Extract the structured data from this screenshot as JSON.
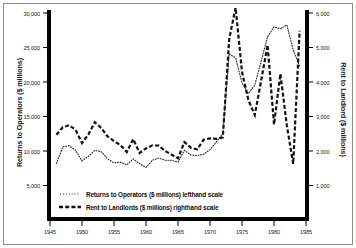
{
  "chart_data": {
    "type": "line",
    "title": "",
    "subtitle": "",
    "xlabel": "",
    "ylabel": "Returns to Operators ($ millions)",
    "ylabel_right": "Rent to Landlord ($ millions)",
    "xlim": [
      1945,
      1985
    ],
    "ylim": [
      0,
      31500
    ],
    "ylim_right": [
      0,
      6300
    ],
    "grid": false,
    "legend_position": "inside-bottom-left",
    "xticks": [
      "1945",
      "1950",
      "1955",
      "1960",
      "1965",
      "1970",
      "1975",
      "1980",
      "1985"
    ],
    "xtick_values": [
      1945,
      1950,
      1955,
      1960,
      1965,
      1970,
      1975,
      1980,
      1985
    ],
    "yticks_left": [
      "5,000",
      "10,000",
      "15,000",
      "20,000",
      "25,000",
      "30,000"
    ],
    "ytick_values_left": [
      5000,
      10000,
      15000,
      20000,
      25000,
      30000
    ],
    "yticks_right": [
      "1,000",
      "2,000",
      "3,000",
      "4,000",
      "5,000",
      "6,000"
    ],
    "ytick_values_right": [
      1000,
      2000,
      3000,
      4000,
      5000,
      6000
    ],
    "x": [
      1946,
      1947,
      1948,
      1949,
      1950,
      1951,
      1952,
      1953,
      1954,
      1955,
      1956,
      1957,
      1958,
      1959,
      1960,
      1961,
      1962,
      1963,
      1964,
      1965,
      1966,
      1967,
      1968,
      1969,
      1970,
      1971,
      1972,
      1973,
      1974,
      1975,
      1976,
      1977,
      1978,
      1979,
      1980,
      1981,
      1982,
      1983,
      1984
    ],
    "series": [
      {
        "name": "Returns to Operators ($ millions) lefthand scale",
        "axis": "left",
        "style": "dotted",
        "color": "#2b2b2b",
        "values": [
          8400,
          10900,
          11100,
          10400,
          8800,
          9500,
          10400,
          10200,
          9100,
          8500,
          8600,
          8200,
          9100,
          8400,
          7800,
          8900,
          9200,
          8900,
          8900,
          8600,
          10400,
          9700,
          9600,
          9800,
          10500,
          11700,
          12900,
          25000,
          24400,
          20600,
          19000,
          20300,
          23900,
          27600,
          29100,
          28800,
          29400,
          25600,
          23200
        ]
      },
      {
        "name": "Rent to Landlords ($ millions) righthand scale",
        "axis": "right",
        "style": "dashed",
        "color": "#111111",
        "values": [
          2550,
          2780,
          2840,
          2700,
          2300,
          2560,
          2930,
          2760,
          2500,
          2360,
          2240,
          2030,
          2420,
          2000,
          2140,
          2230,
          2220,
          2060,
          1950,
          1840,
          2330,
          2160,
          2110,
          2400,
          2440,
          2430,
          2470,
          5450,
          6400,
          4460,
          3600,
          3150,
          4200,
          5270,
          2860,
          4400,
          2840,
          1670,
          5700
        ]
      }
    ],
    "annotations": [
      "Rent to Landlords series exceeds the top of the righthand axis around 1974"
    ]
  },
  "legend": {
    "entries": [
      {
        "label": "Returns to Operators ($ millions) lefthand scale",
        "marker": "dotted-line"
      },
      {
        "label": "Rent to Landlords ($ millions) righthand scale",
        "marker": "dashed-line"
      }
    ]
  },
  "colors": {
    "frame": "#8d8d8d",
    "axis": "#000000",
    "background": "#ffffff",
    "returns_line": "#2b2b2b",
    "rent_line": "#111111"
  }
}
